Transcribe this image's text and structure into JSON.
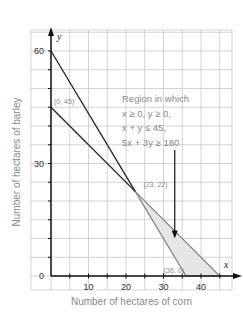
{
  "chart_data": {
    "type": "line",
    "title": "",
    "xlabel": "Number of hectares of corn",
    "ylabel": "Number of hectares of barley",
    "x_var": "x",
    "y_var": "y",
    "xlim": [
      -4,
      50
    ],
    "ylim": [
      -4,
      64
    ],
    "x_ticks": [
      10,
      20,
      30,
      40
    ],
    "y_ticks": [
      0,
      30,
      60
    ],
    "grid_step": 5,
    "grid": true,
    "lines": [
      {
        "name": "x + y = 45",
        "points": [
          [
            0,
            45
          ],
          [
            45,
            0
          ]
        ],
        "color": "#222222"
      },
      {
        "name": "5x + 3y = 180",
        "points": [
          [
            0,
            60
          ],
          [
            36,
            0
          ]
        ],
        "color": "#222222"
      }
    ],
    "feasible_region": {
      "vertices": [
        [
          22.5,
          22.5
        ],
        [
          36,
          0
        ],
        [
          45,
          0
        ]
      ],
      "fill": "#e6e6e6",
      "edge_color": "#8a8a8a"
    },
    "point_labels": [
      {
        "text": "(0, 45)",
        "x": 0,
        "y": 45
      },
      {
        "text": "(23, 22)",
        "x": 22.5,
        "y": 22.5
      },
      {
        "text": "(36, 0)",
        "x": 36,
        "y": 0
      }
    ],
    "annotation": {
      "lines": [
        "Region in which",
        "x ≥ 0, y ≥ 0,",
        "x + y ≤ 45,",
        "5x + 3y ≥ 180"
      ],
      "arrow_to": [
        33,
        10
      ]
    }
  }
}
